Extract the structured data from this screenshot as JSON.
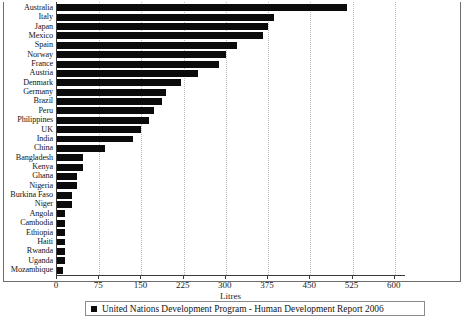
{
  "chart_data": {
    "type": "bar",
    "orientation": "horizontal",
    "title": "",
    "xlabel": "Litres",
    "ylabel": "",
    "xlim": [
      0,
      620
    ],
    "xticks": [
      0,
      75,
      150,
      225,
      300,
      375,
      450,
      525,
      600
    ],
    "grid": true,
    "legend_position": "bottom",
    "legend": [
      "United Nations Development Program - Human Development Report 2006"
    ],
    "series_color": "#0b0b0b",
    "categories": [
      "US",
      "Australia",
      "Italy",
      "Japan",
      "Mexico",
      "Spain",
      "Norway",
      "France",
      "Austria",
      "Denmark",
      "Germany",
      "Brazil",
      "Peru",
      "Philippines",
      "UK",
      "India",
      "China",
      "Bangladesh",
      "Kenya",
      "Ghana",
      "Nigeria",
      "Burkina Faso",
      "Niger",
      "Angola",
      "Cambodia",
      "Ethiopia",
      "Haiti",
      "Rwanda",
      "Uganda",
      "Mozambique"
    ],
    "values": [
      600,
      515,
      385,
      374,
      366,
      320,
      301,
      287,
      250,
      220,
      193,
      187,
      173,
      164,
      149,
      135,
      86,
      46,
      46,
      36,
      36,
      27,
      27,
      15,
      15,
      15,
      15,
      15,
      15,
      10
    ],
    "series": [
      {
        "name": "United Nations Development Program - Human Development Report 2006",
        "values": [
          600,
          515,
          385,
          374,
          366,
          320,
          301,
          287,
          250,
          220,
          193,
          187,
          173,
          164,
          149,
          135,
          86,
          46,
          46,
          36,
          36,
          27,
          27,
          15,
          15,
          15,
          15,
          15,
          15,
          10
        ]
      }
    ]
  },
  "axis": {
    "x_label": "Litres",
    "tick_labels": [
      "0",
      "75",
      "150",
      "225",
      "300",
      "375",
      "450",
      "525",
      "600"
    ]
  },
  "legend": {
    "label": "United Nations Development Program - Human Development Report 2006",
    "swatch_color": "#0b0b0b"
  }
}
